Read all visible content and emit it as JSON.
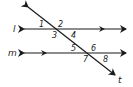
{
  "diagram": {
    "lines": {
      "l": "l",
      "m": "m",
      "t": "t"
    },
    "angles": [
      "1",
      "2",
      "3",
      "4",
      "5",
      "6",
      "7",
      "8"
    ],
    "colors": {
      "stroke": "#1a1a1a",
      "background": "#ffffff"
    }
  }
}
